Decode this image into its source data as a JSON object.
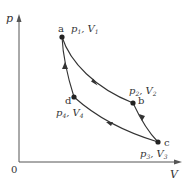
{
  "diagram": {
    "type": "pV-cycle",
    "axes": {
      "y_label": "p",
      "x_label": "V",
      "origin_label": "0"
    },
    "points": [
      {
        "id": "a",
        "label": "a",
        "state": "p1, V1",
        "p_sym": "p",
        "p_sub": "1",
        "v_sym": "V",
        "v_sub": "1"
      },
      {
        "id": "b",
        "label": "b",
        "state": "p2, V2",
        "p_sym": "p",
        "p_sub": "2",
        "v_sym": "V",
        "v_sub": "2"
      },
      {
        "id": "c",
        "label": "c",
        "state": "p3, V3",
        "p_sym": "p",
        "p_sub": "3",
        "v_sym": "V",
        "v_sub": "3"
      },
      {
        "id": "d",
        "label": "d",
        "state": "p4, V4",
        "p_sym": "p",
        "p_sub": "4",
        "v_sym": "V",
        "v_sub": "4"
      }
    ],
    "processes": [
      {
        "from": "a",
        "to": "b",
        "direction": "a→b"
      },
      {
        "from": "b",
        "to": "c",
        "direction": "b→c"
      },
      {
        "from": "c",
        "to": "d",
        "direction": "c→d"
      },
      {
        "from": "d",
        "to": "a",
        "direction": "d→a"
      }
    ]
  }
}
